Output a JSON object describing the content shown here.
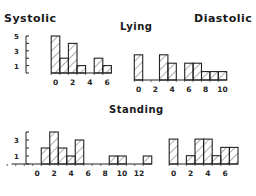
{
  "titles": {
    "systolic": "Systolic",
    "diastolic": "Diastolic",
    "lying": "Lying",
    "standing": "Standing"
  },
  "chart_data": [
    {
      "type": "bar",
      "title": "Lying - Systolic",
      "x": [
        0,
        1,
        2,
        3,
        4,
        5,
        6
      ],
      "values": [
        5,
        2,
        4,
        1,
        0,
        2,
        1
      ],
      "xticks": [
        0,
        2,
        4,
        6
      ],
      "yticks": [
        0,
        1,
        2,
        3,
        4,
        5
      ],
      "ytick_labels": [
        "1",
        "3",
        "5"
      ],
      "xlabel": "",
      "ylabel": "",
      "style": "hatched histogram"
    },
    {
      "type": "bar",
      "title": "Lying - Diastolic",
      "x": [
        0,
        1,
        2,
        3,
        4,
        5,
        6,
        7,
        8,
        9,
        10
      ],
      "values": [
        3,
        0,
        0,
        3,
        2,
        0,
        2,
        2,
        1,
        1,
        1
      ],
      "xticks": [
        0,
        2,
        4,
        6,
        8,
        10
      ],
      "xlabel": "",
      "ylabel": "",
      "style": "hatched histogram"
    },
    {
      "type": "bar",
      "title": "Standing - Systolic",
      "x": [
        0,
        1,
        2,
        3,
        4,
        5,
        6,
        7,
        8,
        9,
        10,
        11,
        12,
        13
      ],
      "values": [
        0,
        2,
        4,
        2,
        1,
        3,
        0,
        0,
        0,
        1,
        1,
        0,
        0,
        1
      ],
      "xticks": [
        0,
        2,
        4,
        6,
        8,
        10,
        12
      ],
      "yticks": [
        0,
        1,
        2,
        3,
        4
      ],
      "ytick_labels": [
        "1",
        "3"
      ],
      "xlabel": "",
      "ylabel": "",
      "style": "hatched histogram"
    },
    {
      "type": "bar",
      "title": "Standing - Diastolic",
      "x": [
        0,
        1,
        2,
        3,
        4,
        5,
        6,
        7
      ],
      "values": [
        3,
        0,
        1,
        3,
        3,
        1,
        2,
        2
      ],
      "xticks": [
        0,
        2,
        4,
        6
      ],
      "xlabel": "",
      "ylabel": "",
      "style": "hatched histogram"
    }
  ]
}
